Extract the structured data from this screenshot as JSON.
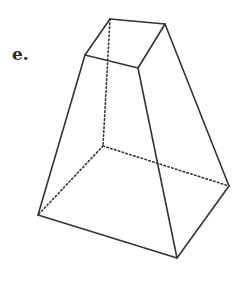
{
  "figure": {
    "label": "e.",
    "shape": "frustum (truncated square pyramid)",
    "line_color": "#333333",
    "edges": {
      "visible": [
        "top-back-left-to-top-back-right",
        "top-back-right-to-top-front-right",
        "top-front-right-to-top-front-left",
        "top-front-left-to-top-back-left",
        "top-front-left-to-bottom-front-left",
        "top-front-right-to-bottom-front-right",
        "top-back-right-to-bottom-back-right",
        "bottom-front-left-to-bottom-front-right",
        "bottom-front-right-to-bottom-back-right"
      ],
      "hidden": [
        "top-back-left-to-bottom-back-left",
        "bottom-back-left-to-bottom-front-left",
        "bottom-back-left-to-bottom-back-right"
      ]
    }
  }
}
